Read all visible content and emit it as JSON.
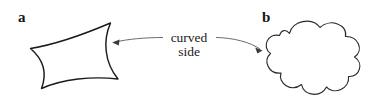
{
  "figure": {
    "background_color": "#ffffff",
    "ink_color": "#1b1b1b",
    "leader_color": "#5a5a5a",
    "width": 375,
    "height": 103
  },
  "labels": {
    "panel_a": "a",
    "panel_b": "b"
  },
  "annotation": {
    "line1": "curved",
    "line2": "side"
  },
  "shapes": {
    "astroid": {
      "name": "concave-quadrilateral",
      "vertices": [
        {
          "x": 30,
          "y": 48
        },
        {
          "x": 110,
          "y": 23
        },
        {
          "x": 118,
          "y": 79
        },
        {
          "x": 41,
          "y": 88
        }
      ]
    },
    "cloud": {
      "name": "scalloped-cloud",
      "bump_count": 9,
      "center": {
        "x": 311,
        "y": 58
      },
      "radius_x": 52,
      "radius_y": 40
    }
  },
  "leaders": {
    "left": {
      "tip_x": 112,
      "tip_y": 42
    },
    "right": {
      "tip_x": 262,
      "tip_y": 50
    }
  }
}
